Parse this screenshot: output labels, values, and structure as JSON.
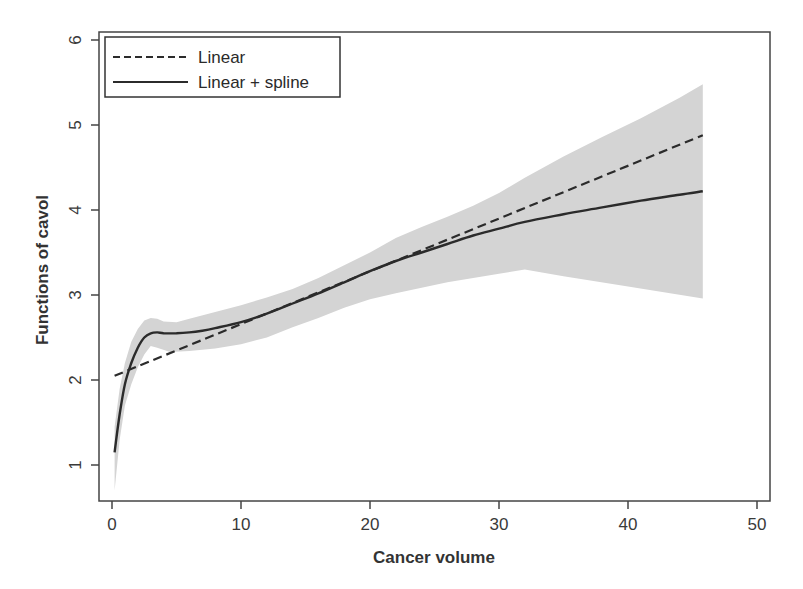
{
  "chart_data": {
    "type": "line",
    "title": "",
    "xlabel": "Cancer volume",
    "ylabel": "Functions of cavol",
    "xlim": [
      -1,
      51
    ],
    "ylim": [
      0.55,
      6.15
    ],
    "xticks": [
      0,
      10,
      20,
      30,
      40,
      50
    ],
    "yticks": [
      1,
      2,
      3,
      4,
      5,
      6
    ],
    "grid": false,
    "legend_position": "top-left",
    "legend": [
      {
        "label": "Linear",
        "style": "dashed"
      },
      {
        "label": "Linear + spline",
        "style": "solid"
      }
    ],
    "series": [
      {
        "name": "Linear",
        "style": "dashed",
        "x": [
          0.2,
          45.8
        ],
        "y": [
          2.05,
          4.88
        ]
      },
      {
        "name": "Linear + spline",
        "style": "solid",
        "x": [
          0.2,
          0.6,
          1,
          1.5,
          2,
          2.5,
          3,
          3.5,
          4,
          5,
          6,
          7,
          8,
          10,
          12,
          14,
          16,
          18,
          20,
          22,
          24,
          26,
          28,
          30,
          32,
          35,
          38,
          41,
          44,
          45.8
        ],
        "y": [
          1.15,
          1.6,
          1.95,
          2.2,
          2.38,
          2.5,
          2.55,
          2.56,
          2.55,
          2.55,
          2.56,
          2.58,
          2.61,
          2.68,
          2.78,
          2.9,
          3.02,
          3.15,
          3.28,
          3.4,
          3.5,
          3.6,
          3.7,
          3.78,
          3.86,
          3.95,
          4.03,
          4.11,
          4.18,
          4.22
        ]
      }
    ],
    "confidence_band": {
      "name": "Linear + spline confidence band",
      "color": "#d4d4d4",
      "upper": {
        "x": [
          0.2,
          0.6,
          1,
          1.5,
          2,
          2.5,
          3,
          3.5,
          4,
          5,
          6,
          8,
          10,
          12,
          14,
          16,
          18,
          20,
          22,
          24,
          26,
          28,
          30,
          32,
          35,
          38,
          41,
          44,
          45.8
        ],
        "y": [
          1.45,
          1.9,
          2.2,
          2.45,
          2.6,
          2.7,
          2.73,
          2.72,
          2.69,
          2.68,
          2.72,
          2.8,
          2.88,
          2.97,
          3.07,
          3.2,
          3.35,
          3.5,
          3.67,
          3.8,
          3.92,
          4.05,
          4.2,
          4.38,
          4.63,
          4.86,
          5.08,
          5.32,
          5.48
        ]
      },
      "lower": {
        "x": [
          0.2,
          0.6,
          1,
          1.5,
          2,
          2.5,
          3,
          3.5,
          4.5,
          6,
          8,
          10,
          12,
          14,
          16,
          18,
          20,
          22,
          26,
          30,
          32,
          35,
          40,
          45.8
        ],
        "y": [
          0.7,
          1.3,
          1.7,
          1.95,
          2.15,
          2.3,
          2.4,
          2.38,
          2.33,
          2.34,
          2.37,
          2.42,
          2.5,
          2.62,
          2.73,
          2.85,
          2.95,
          3.02,
          3.15,
          3.25,
          3.3,
          3.22,
          3.1,
          2.96
        ]
      }
    }
  },
  "colors": {
    "line": "#2b2b2b",
    "band": "#d4d4d4",
    "axis": "#444444"
  }
}
